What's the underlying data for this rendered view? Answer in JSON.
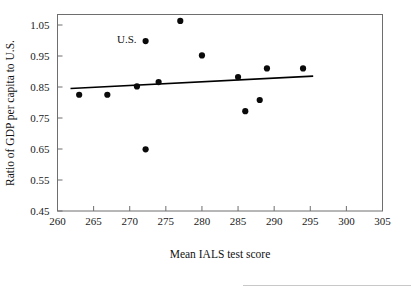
{
  "chart_data": {
    "type": "scatter",
    "title": "",
    "xlabel": "Mean IALS test score",
    "ylabel": "Ratio of GDP per capita to U.S.",
    "xlim": [
      260,
      305
    ],
    "ylim": [
      0.45,
      1.08
    ],
    "grid": false,
    "legend": "none",
    "xticks": [
      260,
      265,
      270,
      275,
      280,
      285,
      290,
      295,
      300,
      305
    ],
    "xtick_labels": [
      "260",
      "265",
      "270",
      "275",
      "280",
      "285",
      "290",
      "295",
      "300",
      "305"
    ],
    "yticks": [
      0.45,
      0.55,
      0.65,
      0.75,
      0.85,
      0.95,
      1.05
    ],
    "ytick_labels": [
      "0.45",
      "0.55",
      "0.65",
      "0.75",
      "0.85",
      "0.95",
      "1.05"
    ],
    "points": [
      {
        "x": 263.0,
        "y": 0.825
      },
      {
        "x": 266.9,
        "y": 0.825
      },
      {
        "x": 271.0,
        "y": 0.852
      },
      {
        "x": 272.2,
        "y": 0.649
      },
      {
        "x": 272.2,
        "y": 0.998
      },
      {
        "x": 274.0,
        "y": 0.866
      },
      {
        "x": 277.0,
        "y": 1.063
      },
      {
        "x": 280.0,
        "y": 0.952
      },
      {
        "x": 285.0,
        "y": 0.882
      },
      {
        "x": 286.0,
        "y": 0.772
      },
      {
        "x": 288.0,
        "y": 0.808
      },
      {
        "x": 289.0,
        "y": 0.91
      },
      {
        "x": 294.0,
        "y": 0.91
      }
    ],
    "annotations": [
      {
        "label": "U.S.",
        "x": 269.6,
        "y": 1.005,
        "points_to": {
          "x": 272.2,
          "y": 0.998
        }
      }
    ],
    "trend_line": {
      "x_start": 261.8,
      "y_start": 0.845,
      "x_end": 295.4,
      "y_end": 0.885
    },
    "colors": {
      "point": "#0a0a0a",
      "trend_line": "#000000",
      "axis": "#6e6e6e",
      "text": "#111111",
      "background": "#ffffff"
    }
  }
}
